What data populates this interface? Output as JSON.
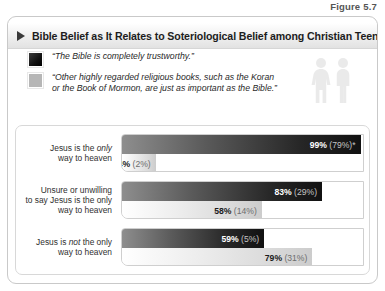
{
  "figure": {
    "caption": "Figure 5.7",
    "title": "Bible Belief as It Relates to Soteriological Belief among Christian Teens",
    "marker_icon": "triangle-right-icon",
    "people_icon": "two-people-icon"
  },
  "legend": {
    "items": [
      {
        "swatch": "dark",
        "text": "“The Bible is completely trustworthy.”"
      },
      {
        "swatch": "light",
        "text": "“Other highly regarded religious books, such as the Koran or the Book of Mormon, are just as important as the Bible.”"
      }
    ]
  },
  "chart_data": {
    "type": "bar",
    "title": "Bible Belief as It Relates to Soteriological Belief among Christian Teens",
    "xlabel": "",
    "ylabel": "",
    "xlim": [
      0,
      100
    ],
    "grid": false,
    "orientation": "horizontal",
    "legend_position": "top-left",
    "categories": [
      "Jesus is the only way to heaven",
      "Unsure or unwilling to say Jesus is the only way to heaven",
      "Jesus is not the only way to heaven"
    ],
    "series": [
      {
        "name": "“The Bible is completely trustworthy.”",
        "values": [
          99,
          83,
          59
        ],
        "secondary_values": [
          79,
          29,
          5
        ],
        "labels": [
          "99% (79%)*",
          "83% (29%)",
          "59% (5%)"
        ]
      },
      {
        "name": "“Other highly regarded religious books, such as the Koran or the Book of Mormon, are just as important as the Bible.”",
        "values": [
          14,
          58,
          79
        ],
        "secondary_values": [
          2,
          14,
          31
        ],
        "labels": [
          "14% (2%)",
          "58% (14%)",
          "79% (31%)"
        ]
      }
    ]
  },
  "groups": [
    {
      "label_html": "Jesus is the <i>only</i><br>way to heaven",
      "dark": {
        "pct": 99,
        "primary": "99%",
        "secondary": "(79%)*"
      },
      "light": {
        "pct": 14,
        "primary": "14%",
        "secondary": "(2%)"
      }
    },
    {
      "label_html": "Unsure or unwilling<br>to say Jesus is the only<br>way to heaven",
      "dark": {
        "pct": 83,
        "primary": "83%",
        "secondary": "(29%)"
      },
      "light": {
        "pct": 58,
        "primary": "58%",
        "secondary": "(14%)"
      }
    },
    {
      "label_html": "Jesus is <i>not</i> the only<br>way to heaven",
      "dark": {
        "pct": 59,
        "primary": "59%",
        "secondary": "(5%)"
      },
      "light": {
        "pct": 79,
        "primary": "79%",
        "secondary": "(31%)"
      }
    }
  ]
}
